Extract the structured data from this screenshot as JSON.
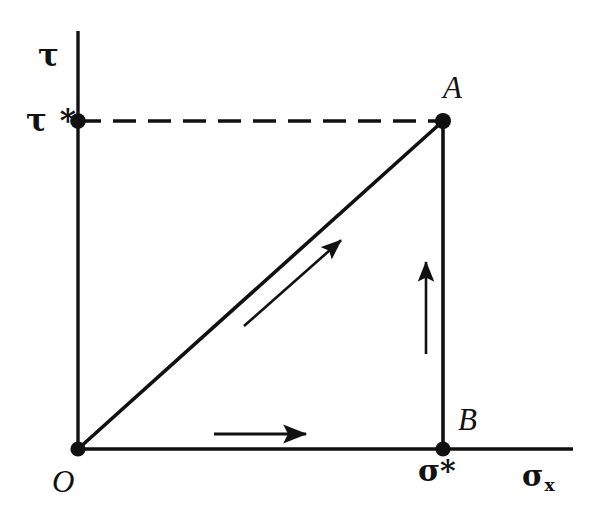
{
  "figure": {
    "background_color": "#ffffff",
    "ink_color": "#111111",
    "width": 606,
    "height": 520
  },
  "axes": {
    "y_axis": {
      "name": "shear-stress-axis",
      "label": "τ",
      "origin_px": [
        78,
        449
      ],
      "end_px": [
        78,
        31
      ]
    },
    "x_axis": {
      "name": "normal-stress-axis",
      "label_base": "σ",
      "label_subscript": "x",
      "origin_px": [
        78,
        449
      ],
      "end_px": [
        573,
        449
      ]
    }
  },
  "ticks": [
    {
      "name": "tau-star-tick",
      "label": "τ *",
      "axis": "y",
      "px": [
        78,
        121
      ]
    },
    {
      "name": "sigma-star-tick",
      "label": "σ*",
      "axis": "x",
      "px": [
        443,
        449
      ]
    }
  ],
  "points": [
    {
      "name": "point-O",
      "label": "O",
      "px": [
        78,
        449
      ],
      "label_px": [
        52,
        466
      ]
    },
    {
      "name": "point-A",
      "label": "A",
      "px": [
        443,
        121
      ],
      "label_px": [
        443,
        72
      ]
    },
    {
      "name": "point-B",
      "label": "B",
      "px": [
        443,
        449
      ],
      "label_px": [
        458,
        404
      ]
    }
  ],
  "lines": [
    {
      "name": "proportional-path-OA",
      "style": "solid",
      "from_px": [
        78,
        449
      ],
      "to_px": [
        443,
        121
      ]
    },
    {
      "name": "path-segment-BA",
      "style": "solid",
      "from_px": [
        443,
        449
      ],
      "to_px": [
        443,
        121
      ]
    },
    {
      "name": "tau-star-guide-line",
      "style": "dashed",
      "from_px": [
        78,
        121
      ],
      "to_px": [
        443,
        121
      ]
    }
  ],
  "arrows": [
    {
      "name": "arrow-along-OA",
      "from_px": [
        244,
        326
      ],
      "to_px": [
        347,
        235
      ]
    },
    {
      "name": "arrow-along-BA",
      "from_px": [
        426,
        354
      ],
      "to_px": [
        426,
        254
      ]
    },
    {
      "name": "arrow-along-OB",
      "from_px": [
        214,
        434
      ],
      "to_px": [
        314,
        434
      ]
    }
  ],
  "chart_data": {
    "type": "line",
    "title": "",
    "xlabel": "σx",
    "ylabel": "τ",
    "grid": false,
    "legend": "none",
    "xlim": [
      0,
      1.355
    ],
    "ylim": [
      0,
      1.0
    ],
    "tick_labels": {
      "x": [
        "σ*"
      ],
      "y": [
        "τ *"
      ]
    },
    "annotations": [
      "O",
      "A",
      "B"
    ],
    "series": [
      {
        "name": "proportional-path-OA",
        "style": "solid",
        "x": [
          0,
          1
        ],
        "y": [
          0,
          1
        ],
        "points": [
          {
            "label": "O",
            "x": 0,
            "y": 0
          },
          {
            "label": "A",
            "x": 1,
            "y": 1
          }
        ]
      },
      {
        "name": "path-segment-BA",
        "style": "solid",
        "x": [
          1,
          1
        ],
        "y": [
          0,
          1
        ],
        "points": [
          {
            "label": "B",
            "x": 1,
            "y": 0
          },
          {
            "label": "A",
            "x": 1,
            "y": 1
          }
        ]
      },
      {
        "name": "tau-star-guide-line",
        "style": "dashed",
        "x": [
          0,
          1
        ],
        "y": [
          1,
          1
        ]
      }
    ]
  }
}
